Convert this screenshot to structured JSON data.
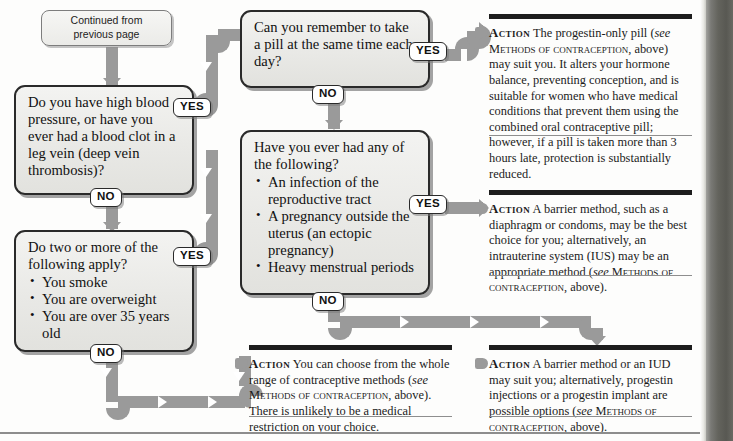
{
  "document": {
    "type": "flowchart",
    "topic": "Contraception decision chart",
    "continued_label_line1": "Continued from",
    "continued_label_line2": "previous page"
  },
  "tags": {
    "yes": "YES",
    "no": "NO"
  },
  "boxes": {
    "start": {
      "name": "continued-from-previous-page",
      "text": "Continued from previous page"
    },
    "q1": {
      "name": "question-blood-pressure",
      "text": "Do you have high blood pressure, or have you ever had a blood clot in a leg vein (deep vein thrombosis)?",
      "yes": "YES",
      "no": "NO"
    },
    "q2": {
      "name": "question-remember-pill",
      "text": "Can you remember to take a pill at the same time each day?",
      "yes": "YES",
      "no": "NO"
    },
    "q3": {
      "name": "question-risk-factors",
      "lead": "Do two or more of the following apply?",
      "items": [
        "You smoke",
        "You are overweight",
        "You are over 35 years old"
      ],
      "yes": "YES",
      "no": "NO"
    },
    "q4": {
      "name": "question-history",
      "lead": "Have you ever had any of the following?",
      "items": [
        "An infection of the reproductive tract",
        "A pregnancy outside the uterus (an ectopic pregnancy)",
        "Heavy menstrual periods"
      ],
      "yes": "YES",
      "no": "NO"
    }
  },
  "actions": {
    "a1": {
      "name": "action-progestin-only-pill",
      "label": "Action",
      "text": "The progestin-only pill (see Methods of contraception, above) may suit you. It alters your hormone balance, preventing conception, and is suitable for women who have medical conditions that prevent them using the combined oral contraceptive pill; however, if a pill is taken more than 3 hours late, protection is substantially reduced."
    },
    "a2": {
      "name": "action-barrier-method-ius",
      "label": "Action",
      "text": "A barrier method, such as a diaphragm or condoms, may be the best choice for you; alternatively, an intrauterine system (IUS) may be an appropriate method (see Methods of contraception, above)."
    },
    "a3": {
      "name": "action-whole-range",
      "label": "Action",
      "text": "You can choose from the whole range of contraceptive methods (see Methods of contraception, above). There is unlikely to be a medical restriction on your choice."
    },
    "a4": {
      "name": "action-barrier-or-iud",
      "label": "Action",
      "text": "A barrier method or an IUD may suit you; alternatively, progestin injections or a progestin implant are possible options (see Methods of contraception, above)."
    }
  },
  "colors": {
    "connector": "#9a9a9a",
    "box_border": "#2a2a2a",
    "box_fill": "#eceae7",
    "rule": "#1d1d1d",
    "page_edge": "#55554f"
  }
}
